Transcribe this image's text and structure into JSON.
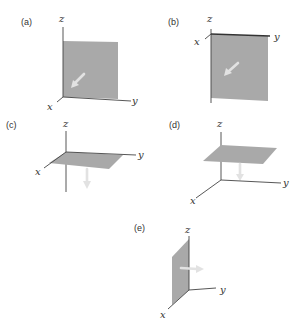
{
  "figure": {
    "colors": {
      "plane": "#a9a9a9",
      "axis": "#444444",
      "arrow": "#e2e2e2",
      "background": "#ffffff"
    },
    "panels": [
      {
        "id": "a",
        "label": "(a)",
        "axes": {
          "x": "x",
          "y": "y",
          "z": "z"
        },
        "plane": "xz-plane (vertical, facing viewer)",
        "arrow": "points out of plane toward +x (diagonal toward viewer)"
      },
      {
        "id": "b",
        "label": "(b)",
        "axes": {
          "x": "x",
          "y": "y",
          "z": "z"
        },
        "plane": "vertical plane hanging below y-axis",
        "arrow": "points toward -x (diagonal down-left)"
      },
      {
        "id": "c",
        "label": "(c)",
        "axes": {
          "x": "x",
          "y": "y",
          "z": "z"
        },
        "plane": "xy-plane (horizontal)",
        "arrow": "points downward (-z)"
      },
      {
        "id": "d",
        "label": "(d)",
        "axes": {
          "x": "x",
          "y": "y",
          "z": "z"
        },
        "plane": "horizontal plane above xy-plane",
        "arrow": "points downward (-z) toward xy-plane"
      },
      {
        "id": "e",
        "label": "(e)",
        "axes": {
          "x": "x",
          "y": "y",
          "z": "z"
        },
        "plane": "xz-plane (vertical, edge-on)",
        "arrow": "points toward +y"
      }
    ]
  }
}
